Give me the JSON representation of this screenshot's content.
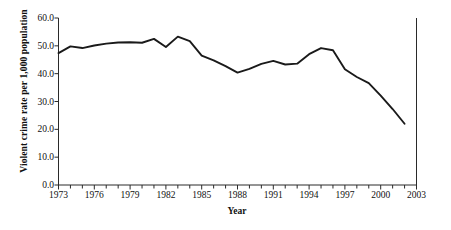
{
  "chart_data": {
    "type": "line",
    "title": "",
    "xlabel": "Year",
    "ylabel": "Violent crime rate per 1,000 population",
    "xlim": [
      1973,
      2003
    ],
    "ylim": [
      0.0,
      60.0
    ],
    "grid": false,
    "legend": null,
    "x_tick_labels": [
      "1973",
      "1976",
      "1979",
      "1982",
      "1985",
      "1988",
      "1991",
      "1994",
      "1997",
      "2000",
      "2003"
    ],
    "x_tick_values": [
      1973,
      1976,
      1979,
      1982,
      1985,
      1988,
      1991,
      1994,
      1997,
      2000,
      2003
    ],
    "x_minor_tick_interval": 1,
    "y_tick_labels": [
      "0.0",
      "10.0",
      "20.0",
      "30.0",
      "40.0",
      "50.0",
      "60.0"
    ],
    "y_tick_values": [
      0.0,
      10.0,
      20.0,
      30.0,
      40.0,
      50.0,
      60.0
    ],
    "line_color": "#1a1a1a",
    "line_width": 1.9,
    "x": [
      1973,
      1974,
      1975,
      1976,
      1977,
      1978,
      1979,
      1980,
      1981,
      1982,
      1983,
      1984,
      1985,
      1986,
      1987,
      1988,
      1989,
      1990,
      1991,
      1992,
      1993,
      1994,
      1995,
      1996,
      1997,
      1998,
      1999,
      2000,
      2001,
      2002
    ],
    "values": [
      47.4,
      49.8,
      49.2,
      50.1,
      50.8,
      51.2,
      51.3,
      51.1,
      52.5,
      49.6,
      53.3,
      51.7,
      46.5,
      44.8,
      42.7,
      40.4,
      41.7,
      43.5,
      44.6,
      43.3,
      43.6,
      47.0,
      49.2,
      48.4,
      48.8,
      50.2,
      51.0,
      50.8,
      41.6,
      38.8
    ],
    "values_note": "series continues to 2002",
    "series_extra_x": [
      1997,
      1998,
      1999,
      2000,
      2001,
      2002
    ],
    "series_extra_values": [
      41.6,
      38.8,
      36.6,
      32.1,
      27.3,
      22.0
    ],
    "annotations": []
  },
  "axes": {
    "y_title": "Violent crime rate per 1,000 population",
    "x_title": "Year"
  }
}
